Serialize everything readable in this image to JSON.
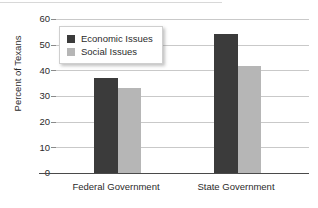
{
  "chart_data": {
    "type": "bar",
    "title": "",
    "xlabel": "",
    "ylabel": "Percent of Texans",
    "categories": [
      "Federal Government",
      "State Government"
    ],
    "series": [
      {
        "name": "Economic Issues",
        "color": "#3b3b3b",
        "values": [
          37,
          54
        ]
      },
      {
        "name": "Social Issues",
        "color": "#b6b6b6",
        "values": [
          33,
          41.5
        ]
      }
    ],
    "ylim": [
      0,
      60
    ],
    "yticks": [
      0,
      10,
      20,
      30,
      40,
      50,
      60
    ],
    "ytick_labels": [
      "0",
      "10",
      "20",
      "30",
      "40",
      "50",
      "60"
    ],
    "grid": true,
    "legend_position": "upper-left-inside"
  },
  "legend": {
    "items": [
      {
        "label": "Economic Issues",
        "swatch": "dark"
      },
      {
        "label": "Social Issues",
        "swatch": "light"
      }
    ]
  },
  "axes": {
    "y_title": "Percent of Texans",
    "y_labels": [
      "60",
      "50",
      "40",
      "30",
      "20",
      "10",
      "0"
    ],
    "x_labels": [
      "Federal Government",
      "State Government"
    ]
  }
}
